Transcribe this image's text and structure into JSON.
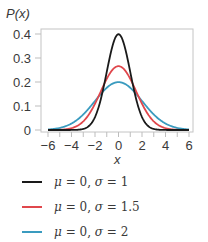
{
  "chart_data": {
    "type": "line",
    "title": "",
    "ylabel": "P(x)",
    "xlabel": "x",
    "xlim": [
      -6,
      6
    ],
    "ylim": [
      0,
      0.4
    ],
    "xticks": [
      -6,
      -4,
      -2,
      0,
      2,
      4,
      6
    ],
    "xtick_labels": [
      "−6",
      "−4",
      "−2",
      "0",
      "2",
      "4",
      "6"
    ],
    "yticks": [
      0,
      0.1,
      0.2,
      0.3,
      0.4
    ],
    "ytick_labels": [
      "0",
      "0.1",
      "0.2",
      "0.3",
      "0.4"
    ],
    "grid": false,
    "legend_position": "below",
    "series": [
      {
        "name": "μ = 0, σ = 1",
        "mu": 0,
        "sigma": 1,
        "color": "#1a1a1a",
        "peak": 0.399
      },
      {
        "name": "μ = 0, σ = 1.5",
        "mu": 0,
        "sigma": 1.5,
        "color": "#e0474c",
        "peak": 0.266
      },
      {
        "name": "μ = 0, σ = 2",
        "mu": 0,
        "sigma": 2,
        "color": "#3a9bbf",
        "peak": 0.199
      }
    ]
  },
  "legend": {
    "items": [
      {
        "mu_sym": "μ",
        "eq1": " = 0, ",
        "sigma_sym": "σ",
        "eq2": " = 1",
        "color": "#1a1a1a"
      },
      {
        "mu_sym": "μ",
        "eq1": " = 0, ",
        "sigma_sym": "σ",
        "eq2": " = 1.5",
        "color": "#e0474c"
      },
      {
        "mu_sym": "μ",
        "eq1": " = 0, ",
        "sigma_sym": "σ",
        "eq2": " = 2",
        "color": "#3a9bbf"
      }
    ]
  },
  "colors": {
    "axis": "#bdbdbd",
    "text": "#3a3a3a"
  }
}
